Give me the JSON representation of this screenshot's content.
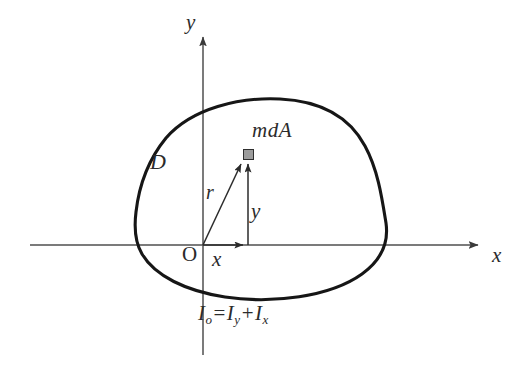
{
  "figure": {
    "type": "geometry-diagram",
    "background_color": "#ffffff",
    "stroke_color": "#1c1c1c",
    "axis_color": "#4a4a4a",
    "marker_fill_color": "#9c9c9c"
  },
  "axes": {
    "y_label": "y",
    "x_label": "x",
    "origin_label": "O"
  },
  "labels": {
    "region": "D",
    "element": "mdA",
    "radius": "r",
    "y_segment": "y",
    "x_segment": "x"
  },
  "formula": {
    "lhs": "I",
    "lhs_sub": "o",
    "equals": "=",
    "term1": "I",
    "term1_sub": "y",
    "plus": "+",
    "term2": "I",
    "term2_sub": "x",
    "plain": "Io = Iy + Ix"
  },
  "geometry": {
    "origin": [
      203,
      245
    ],
    "point_mdA": [
      248,
      155
    ],
    "x_axis_span": [
      30,
      480
    ],
    "y_axis_span": [
      35,
      355
    ],
    "region_extent": {
      "left": 136,
      "right": 386,
      "top": 99,
      "bottom": 297
    }
  }
}
